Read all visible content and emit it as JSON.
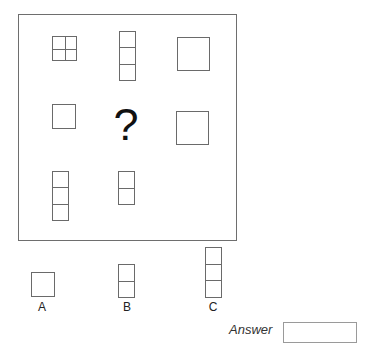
{
  "puzzle": {
    "missing_symbol": "?",
    "grid": [
      [
        {
          "shape": "square-divided-2x2"
        },
        {
          "shape": "vertical-stack",
          "cells": 3
        },
        {
          "shape": "large-square"
        }
      ],
      [
        {
          "shape": "small-square"
        },
        {
          "shape": "missing"
        },
        {
          "shape": "large-square"
        }
      ],
      [
        {
          "shape": "vertical-stack",
          "cells": 3
        },
        {
          "shape": "vertical-stack",
          "cells": 2
        },
        {
          "shape": "empty"
        }
      ]
    ]
  },
  "options": [
    {
      "label": "A",
      "shape": "small-square"
    },
    {
      "label": "B",
      "shape": "vertical-stack",
      "cells": 2
    },
    {
      "label": "C",
      "shape": "vertical-stack",
      "cells": 3
    }
  ],
  "answer": {
    "label": "Answer",
    "value": ""
  }
}
